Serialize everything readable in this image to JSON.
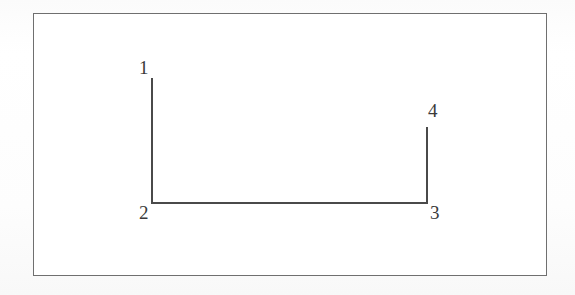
{
  "figure": {
    "background_color": "#fcfcfc",
    "paper_color": "#ffffff",
    "frame": {
      "border_color": "#6f6f6f",
      "border_width_px": 1,
      "x": 33,
      "y": 13,
      "width": 514,
      "height": 263
    },
    "stroke_color": "#4a4a4a",
    "stroke_width_px": 2,
    "labels": {
      "one": "1",
      "two": "2",
      "three": "3",
      "four": "4"
    }
  },
  "chart_data": {
    "type": "line",
    "title": "",
    "subtitle": "",
    "xlabel": "",
    "ylabel": "",
    "grid": false,
    "legend": "none",
    "annotations": [
      "1",
      "2",
      "3",
      "4"
    ],
    "points": [
      {
        "label": "1",
        "x": 152,
        "y": 78
      },
      {
        "label": "2",
        "x": 152,
        "y": 203
      },
      {
        "label": "3",
        "x": 427,
        "y": 203
      },
      {
        "label": "4",
        "x": 427,
        "y": 127
      }
    ],
    "path_order": [
      "1",
      "2",
      "3",
      "4"
    ],
    "x": [
      152,
      152,
      427,
      427
    ],
    "y": [
      78,
      203,
      203,
      127
    ],
    "xlim": [
      33,
      547
    ],
    "ylim": [
      276,
      13
    ]
  }
}
